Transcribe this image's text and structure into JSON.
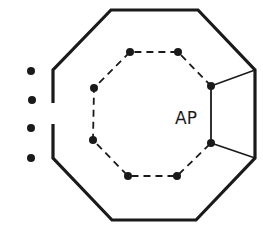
{
  "diagram": {
    "label": "AP",
    "colors": {
      "stroke": "#1a1a1a",
      "background": "#ffffff"
    },
    "outer_octagon": {
      "style": "solid",
      "gap_side": "left"
    },
    "inner_octagon": {
      "style": "dashed",
      "vertices": 8
    },
    "left_dots": 4
  }
}
